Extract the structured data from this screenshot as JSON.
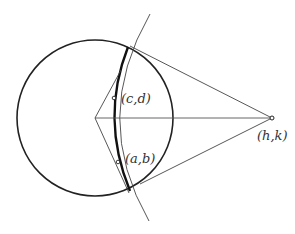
{
  "diagram": {
    "labels": {
      "cd": "(c,d)",
      "ab": "(a,b)",
      "hk": "(h,k)"
    },
    "colors": {
      "stroke": "#222222",
      "thin_stroke": "#444444",
      "background": "#ffffff"
    }
  }
}
